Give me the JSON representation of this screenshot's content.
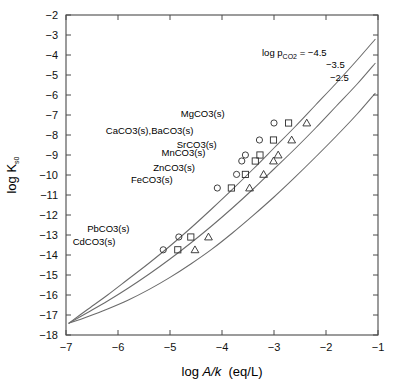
{
  "chart_data": {
    "type": "line",
    "title": "",
    "xlabel": "log A/k  (eq/L)",
    "ylabel": "log K s0",
    "xlim": [
      -7,
      -1
    ],
    "ylim": [
      -18,
      -2
    ],
    "grid": false,
    "legend_position": "inline-annotation",
    "xticks": [
      "-7",
      "-6",
      "-5",
      "-4",
      "-3",
      "-2",
      "-1"
    ],
    "yticks": [
      "-2",
      "-3",
      "-4",
      "-5",
      "-6",
      "-7",
      "-8",
      "-9",
      "-10",
      "-11",
      "-12",
      "-13",
      "-14",
      "-15",
      "-16",
      "-17",
      "-18"
    ],
    "annotation_prefix": "log p",
    "annotation_sub": "CO2",
    "annotation_eq": "=",
    "series": [
      {
        "name": "-4.5",
        "label": "-4.5",
        "marker": "circle",
        "x": [
          -6.95,
          -6.6,
          -6.2,
          -5.8,
          -5.4,
          -5.0,
          -4.6,
          -4.2,
          -3.8,
          -3.4,
          -3.0,
          -2.6,
          -2.2,
          -1.8,
          -1.4,
          -1.05
        ],
        "y": [
          -17.42,
          -16.75,
          -16.0,
          -15.2,
          -14.4,
          -13.55,
          -12.65,
          -11.7,
          -10.72,
          -9.7,
          -8.65,
          -7.6,
          -6.5,
          -5.4,
          -4.25,
          -3.2
        ]
      },
      {
        "name": "-3.5",
        "label": "-3.5",
        "marker": "square",
        "x": [
          -6.95,
          -6.6,
          -6.2,
          -5.8,
          -5.4,
          -5.0,
          -4.6,
          -4.2,
          -3.8,
          -3.4,
          -3.0,
          -2.6,
          -2.2,
          -1.8,
          -1.4,
          -1.05
        ],
        "y": [
          -17.42,
          -16.9,
          -16.3,
          -15.65,
          -14.95,
          -14.2,
          -13.4,
          -12.55,
          -11.65,
          -10.7,
          -9.7,
          -8.7,
          -7.65,
          -6.55,
          -5.45,
          -4.4
        ]
      },
      {
        "name": "-2.5",
        "label": "-2.5",
        "marker": "triangle",
        "x": [
          -6.95,
          -6.6,
          -6.2,
          -5.8,
          -5.4,
          -5.0,
          -4.6,
          -4.2,
          -3.8,
          -3.4,
          -3.0,
          -2.6,
          -2.2,
          -1.8,
          -1.4,
          -1.05
        ],
        "y": [
          -17.42,
          -17.1,
          -16.7,
          -16.25,
          -15.72,
          -15.12,
          -14.45,
          -13.72,
          -12.9,
          -12.02,
          -11.1,
          -10.12,
          -9.1,
          -8.05,
          -6.95,
          -5.9
        ]
      }
    ],
    "compounds": [
      {
        "label": "MgCO3(s)",
        "ksp": -7.4,
        "label_x": -3.95,
        "label_y": -7.1,
        "points": [
          {
            "series": "-4.5",
            "x": -3.0,
            "y": -7.4,
            "marker": "circle"
          },
          {
            "series": "-3.5",
            "x": -2.72,
            "y": -7.4,
            "marker": "square"
          },
          {
            "series": "-2.5",
            "x": -2.37,
            "y": -7.4,
            "marker": "triangle"
          }
        ]
      },
      {
        "label": "CaCO3(s),BaCO3(s)",
        "ksp": -8.25,
        "label_x": -4.55,
        "label_y": -7.95,
        "points": [
          {
            "series": "-4.5",
            "x": -3.28,
            "y": -8.25,
            "marker": "circle"
          },
          {
            "series": "-3.5",
            "x": -3.01,
            "y": -8.25,
            "marker": "square"
          },
          {
            "series": "-2.5",
            "x": -2.66,
            "y": -8.25,
            "marker": "triangle"
          }
        ]
      },
      {
        "label": "SrCO3(s)",
        "ksp": -9.0,
        "label_x": -4.1,
        "label_y": -8.65,
        "points": [
          {
            "series": "-4.5",
            "x": -3.55,
            "y": -9.0,
            "marker": "circle"
          },
          {
            "series": "-3.5",
            "x": -3.27,
            "y": -9.0,
            "marker": "square"
          },
          {
            "series": "-2.5",
            "x": -2.92,
            "y": -9.0,
            "marker": "triangle"
          }
        ]
      },
      {
        "label": "MnCO3(s)",
        "ksp": -9.3,
        "label_x": -4.32,
        "label_y": -9.05,
        "points": [
          {
            "series": "-4.5",
            "x": -3.62,
            "y": -9.3,
            "marker": "circle"
          },
          {
            "series": "-3.5",
            "x": -3.36,
            "y": -9.3,
            "marker": "square"
          },
          {
            "series": "-2.5",
            "x": -3.01,
            "y": -9.3,
            "marker": "triangle"
          }
        ]
      },
      {
        "label": "ZnCO3(s)",
        "ksp": -10.0,
        "label_x": -4.52,
        "label_y": -9.78,
        "points": [
          {
            "series": "-4.5",
            "x": -3.72,
            "y": -9.97,
            "marker": "circle"
          },
          {
            "series": "-3.5",
            "x": -3.55,
            "y": -9.97,
            "marker": "square"
          },
          {
            "series": "-2.5",
            "x": -3.2,
            "y": -9.97,
            "marker": "triangle"
          }
        ]
      },
      {
        "label": "FeCO3(s)",
        "ksp": -10.65,
        "label_x": -4.95,
        "label_y": -10.42,
        "points": [
          {
            "series": "-4.5",
            "x": -4.09,
            "y": -10.65,
            "marker": "circle"
          },
          {
            "series": "-3.5",
            "x": -3.82,
            "y": -10.65,
            "marker": "square"
          },
          {
            "series": "-2.5",
            "x": -3.47,
            "y": -10.65,
            "marker": "triangle"
          }
        ]
      },
      {
        "label": "PbCO3(s)",
        "ksp": -13.1,
        "label_x": -5.78,
        "label_y": -12.85,
        "points": [
          {
            "series": "-4.5",
            "x": -4.83,
            "y": -13.1,
            "marker": "circle"
          },
          {
            "series": "-3.5",
            "x": -4.6,
            "y": -13.1,
            "marker": "square"
          },
          {
            "series": "-2.5",
            "x": -4.26,
            "y": -13.1,
            "marker": "triangle"
          }
        ]
      },
      {
        "label": "CdCO3(s)",
        "ksp": -13.74,
        "label_x": -6.05,
        "label_y": -13.5,
        "points": [
          {
            "series": "-4.5",
            "x": -5.13,
            "y": -13.74,
            "marker": "circle"
          },
          {
            "series": "-3.5",
            "x": -4.85,
            "y": -13.74,
            "marker": "square"
          },
          {
            "series": "-2.5",
            "x": -4.52,
            "y": -13.74,
            "marker": "triangle"
          }
        ]
      }
    ]
  }
}
